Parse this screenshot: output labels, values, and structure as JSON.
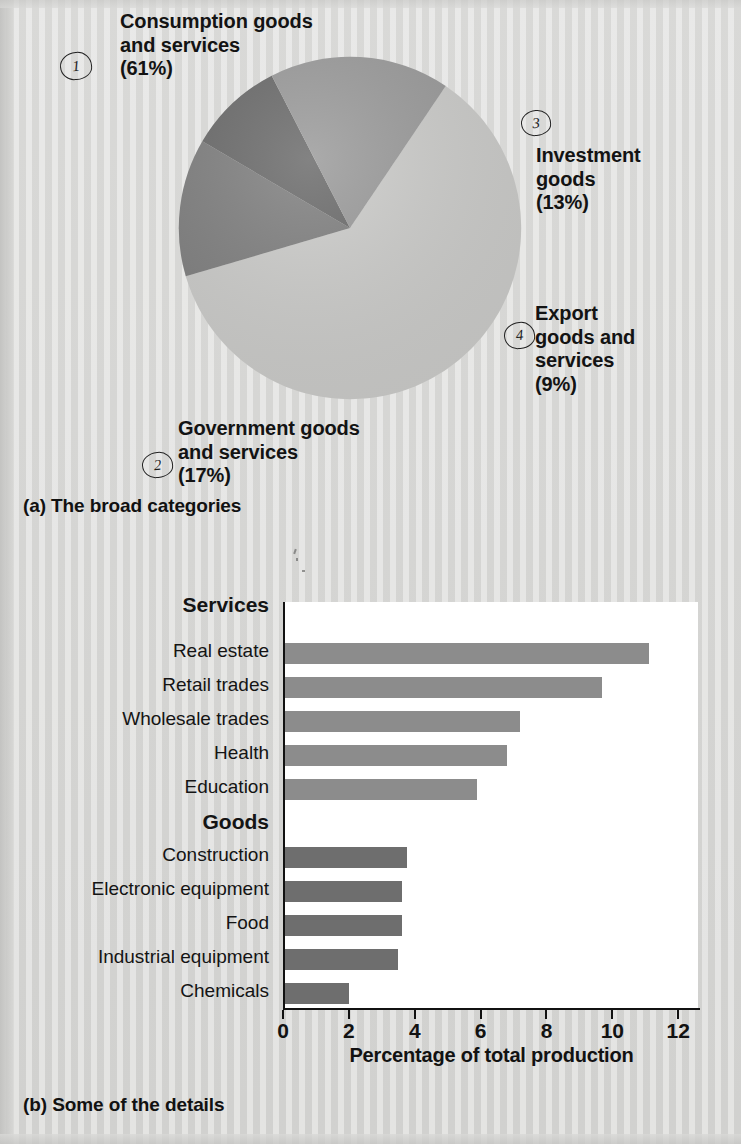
{
  "figure": {
    "panel_a_caption": "(a) The broad categories",
    "panel_b_caption": "(b) Some of the details"
  },
  "pie": {
    "labels": [
      {
        "id": "consumption",
        "text": "Consumption goods\nand services\n(61%)",
        "marker": "1"
      },
      {
        "id": "investment",
        "text": "Investment\ngoods\n(13%)",
        "marker": "3"
      },
      {
        "id": "export",
        "text": "Export\ngoods and\nservices\n(9%)",
        "marker": "4"
      },
      {
        "id": "government",
        "text": "Government goods\nand services\n(17%)",
        "marker": "2"
      }
    ]
  },
  "bar": {
    "group_services": "Services",
    "group_goods": "Goods",
    "categories": [
      "Real estate",
      "Retail trades",
      "Wholesale trades",
      "Health",
      "Education",
      "Construction",
      "Electronic equipment",
      "Food",
      "Industrial equipment",
      "Chemicals"
    ],
    "ticklabels": [
      "0",
      "2",
      "4",
      "6",
      "8",
      "10",
      "12"
    ],
    "xtitle": "Percentage of total production"
  },
  "colors": {
    "consumption": "#cdcdcb",
    "investment": "#808080",
    "export": "#6b6b6b",
    "government": "#9b9b9b",
    "services_bar": "#8c8c8c",
    "goods_bar": "#6e6e6e",
    "ink": "#121212",
    "page": "#d9d9d7",
    "plot_bg": "#ffffff"
  },
  "chart_data": [
    {
      "type": "pie",
      "title": "The broad categories",
      "labels": [
        "Consumption goods and services",
        "Investment goods",
        "Export goods and services",
        "Government goods and services"
      ],
      "values": [
        61,
        13,
        9,
        17
      ],
      "unit": "%",
      "slice_colors": [
        "#cdcdcb",
        "#808080",
        "#6b6b6b",
        "#9b9b9b"
      ],
      "legend": "inline-annotations",
      "annotation_markers": [
        "1",
        "3",
        "4",
        "2"
      ],
      "start_angle_deg": -56,
      "direction": "clockwise"
    },
    {
      "type": "bar",
      "orientation": "horizontal",
      "title": "Some of the details",
      "xlabel": "Percentage of total production",
      "ylabel": "",
      "xlim": [
        0,
        12.6
      ],
      "xticks": [
        0,
        2,
        4,
        6,
        8,
        10,
        12
      ],
      "grid": false,
      "groups": [
        {
          "name": "Services",
          "color": "#8c8c8c",
          "categories": [
            "Real estate",
            "Retail trades",
            "Wholesale trades",
            "Health",
            "Education"
          ],
          "values": [
            11.1,
            9.7,
            7.2,
            6.8,
            5.9
          ]
        },
        {
          "name": "Goods",
          "color": "#6e6e6e",
          "categories": [
            "Construction",
            "Electronic equipment",
            "Food",
            "Industrial equipment",
            "Chemicals"
          ],
          "values": [
            3.75,
            3.6,
            3.6,
            3.5,
            2.0
          ]
        }
      ],
      "categories": [
        "Real estate",
        "Retail trades",
        "Wholesale trades",
        "Health",
        "Education",
        "Construction",
        "Electronic equipment",
        "Food",
        "Industrial equipment",
        "Chemicals"
      ],
      "values": [
        11.1,
        9.7,
        7.2,
        6.8,
        5.9,
        3.75,
        3.6,
        3.6,
        3.5,
        2.0
      ]
    }
  ]
}
